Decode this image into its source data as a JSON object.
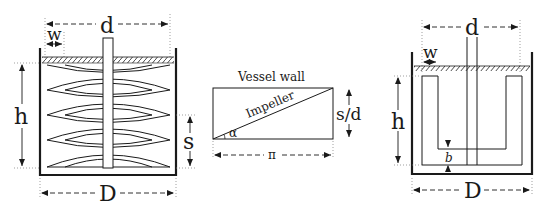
{
  "figure": {
    "colors": {
      "line": "#1a1a1a",
      "background": "#ffffff",
      "dim_line": "#555555"
    },
    "helical_ribbon_vessel": {
      "label_d": "d",
      "label_w": "w",
      "label_h": "h",
      "label_s": "s",
      "label_D": "D"
    },
    "unrolled_helix": {
      "label_vessel_wall": "Vessel wall",
      "label_impeller": "Impeller",
      "label_alpha": "α",
      "label_s_over_d": "s/d",
      "label_pi": "π"
    },
    "anchor_vessel": {
      "label_d": "d",
      "label_w": "w",
      "label_h": "h",
      "label_b": "b",
      "label_D": "D"
    }
  }
}
